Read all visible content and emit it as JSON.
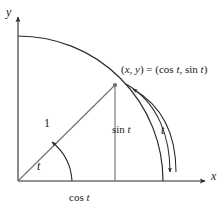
{
  "figure": {
    "kind": "unit-circle-trigonometry-diagram",
    "stroke_color": "#2b2b2b",
    "background_color": "#ffffff",
    "axes": {
      "x_label": "x",
      "y_label": "y"
    },
    "labels": {
      "point": {
        "prefix": "(",
        "x_var": "x",
        "comma": ", ",
        "y_var": "y",
        "equals": ") = (cos ",
        "t1": "t",
        "mid": ", sin ",
        "t2": "t",
        "suffix": ")",
        "full_text": "(x, y) = (cos t, sin t)"
      },
      "radius": "1",
      "angle": "t",
      "sine": {
        "fn": "sin ",
        "var": "t",
        "full_text": "sin t"
      },
      "cosine": {
        "fn": "cos ",
        "var": "t",
        "full_text": "cos t"
      },
      "arc": "t"
    },
    "geometry": {
      "origin": [
        18,
        181
      ],
      "radius_px": 145,
      "angle_degrees": 50,
      "point_on_circle": [
        115,
        85
      ],
      "x_axis_tip": [
        208,
        181
      ],
      "y_axis_tip": [
        18,
        14
      ],
      "circle_x_intercept": [
        163,
        181
      ],
      "circle_y_intercept": [
        18,
        38
      ]
    }
  }
}
